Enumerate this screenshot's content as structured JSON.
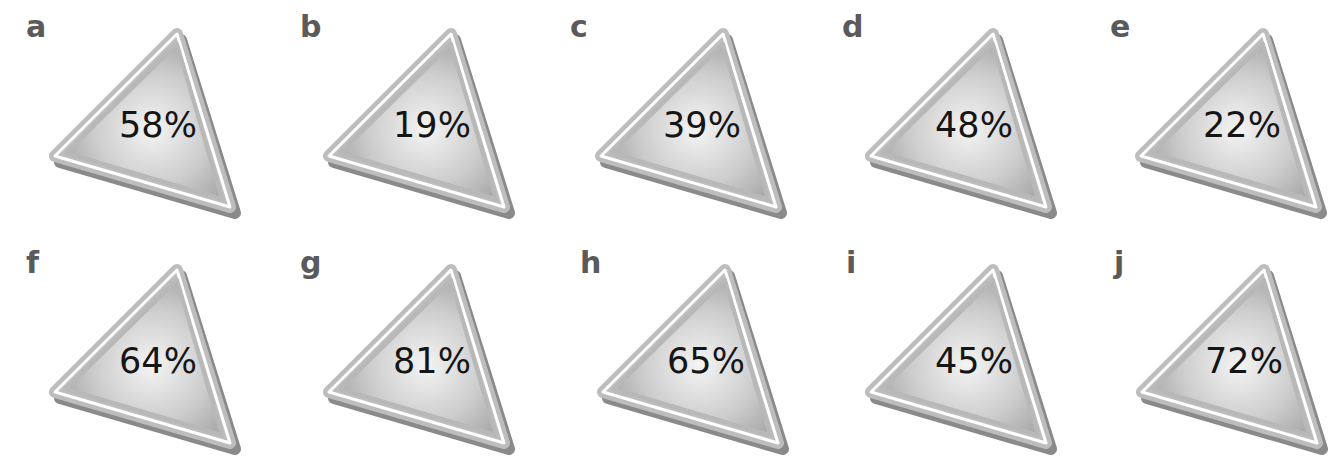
{
  "colors": {
    "background": "#ffffff",
    "triangle_fill_light": "#f2f2f2",
    "triangle_fill_dark": "#a8a8a8",
    "triangle_rim": "#b5b5b5",
    "triangle_shadow": "#8a8a8a",
    "label_text": "#5a5a5a",
    "value_text": "#151515"
  },
  "panels": [
    {
      "label": "a",
      "value": "58%"
    },
    {
      "label": "b",
      "value": "19%"
    },
    {
      "label": "c",
      "value": "39%"
    },
    {
      "label": "d",
      "value": "48%"
    },
    {
      "label": "e",
      "value": "22%"
    },
    {
      "label": "f",
      "value": "64%"
    },
    {
      "label": "g",
      "value": "81%"
    },
    {
      "label": "h",
      "value": "65%"
    },
    {
      "label": "i",
      "value": "45%"
    },
    {
      "label": "j",
      "value": "72%"
    }
  ]
}
